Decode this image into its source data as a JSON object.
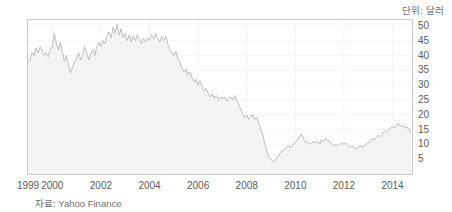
{
  "unit_label": "단위: 달러",
  "source_label": "자료: Yahoo Finance",
  "colors": {
    "line": "#b4b4b4",
    "area_fill": "#f4f4f4",
    "grid": "#eeeeee",
    "frame": "#c9c9c9",
    "tick_text": "#5b5b5b",
    "caption_text": "#6f6f6f",
    "background": "#ffffff"
  },
  "chart_data": {
    "type": "area",
    "title": "",
    "subtitle": "",
    "xlabel": "",
    "ylabel": "",
    "unit": "달러",
    "source": "Yahoo Finance",
    "grid": true,
    "legend": "none",
    "xlim": [
      1999.0,
      2014.8
    ],
    "ylim": [
      0,
      52
    ],
    "yticks": [
      5,
      10,
      15,
      20,
      25,
      30,
      35,
      40,
      45,
      50
    ],
    "ytick_labels": [
      "5",
      "10",
      "15",
      "20",
      "25",
      "30",
      "35",
      "40",
      "45",
      "50"
    ],
    "xticks": [
      1999,
      2000,
      2002,
      2004,
      2006,
      2008,
      2010,
      2012,
      2014
    ],
    "xtick_labels": [
      "1999",
      "2000",
      "2002",
      "2004",
      "2006",
      "2008",
      "2010",
      "2012",
      "2014"
    ],
    "series": [
      {
        "name": "주가",
        "x": [
          1999.0,
          1999.08,
          1999.17,
          1999.25,
          1999.33,
          1999.42,
          1999.5,
          1999.58,
          1999.67,
          1999.75,
          1999.83,
          1999.92,
          2000.0,
          2000.08,
          2000.17,
          2000.25,
          2000.33,
          2000.42,
          2000.5,
          2000.58,
          2000.67,
          2000.75,
          2000.83,
          2000.92,
          2001.0,
          2001.08,
          2001.17,
          2001.25,
          2001.33,
          2001.42,
          2001.5,
          2001.58,
          2001.67,
          2001.75,
          2001.83,
          2001.92,
          2002.0,
          2002.08,
          2002.17,
          2002.25,
          2002.33,
          2002.42,
          2002.5,
          2002.58,
          2002.67,
          2002.75,
          2002.83,
          2002.92,
          2003.0,
          2003.08,
          2003.17,
          2003.25,
          2003.33,
          2003.42,
          2003.5,
          2003.58,
          2003.67,
          2003.75,
          2003.83,
          2003.92,
          2004.0,
          2004.08,
          2004.17,
          2004.25,
          2004.33,
          2004.42,
          2004.5,
          2004.58,
          2004.67,
          2004.75,
          2004.83,
          2004.92,
          2005.0,
          2005.08,
          2005.17,
          2005.25,
          2005.33,
          2005.42,
          2005.5,
          2005.58,
          2005.67,
          2005.75,
          2005.83,
          2005.92,
          2006.0,
          2006.08,
          2006.17,
          2006.25,
          2006.33,
          2006.42,
          2006.5,
          2006.58,
          2006.67,
          2006.75,
          2006.83,
          2006.92,
          2007.0,
          2007.08,
          2007.17,
          2007.25,
          2007.33,
          2007.42,
          2007.5,
          2007.58,
          2007.67,
          2007.75,
          2007.83,
          2007.92,
          2008.0,
          2008.08,
          2008.17,
          2008.25,
          2008.33,
          2008.42,
          2008.5,
          2008.58,
          2008.67,
          2008.75,
          2008.83,
          2008.92,
          2009.0,
          2009.08,
          2009.17,
          2009.25,
          2009.33,
          2009.42,
          2009.5,
          2009.58,
          2009.67,
          2009.75,
          2009.83,
          2009.92,
          2010.0,
          2010.08,
          2010.17,
          2010.25,
          2010.33,
          2010.42,
          2010.5,
          2010.58,
          2010.67,
          2010.75,
          2010.83,
          2010.92,
          2011.0,
          2011.08,
          2011.17,
          2011.25,
          2011.33,
          2011.42,
          2011.5,
          2011.58,
          2011.67,
          2011.75,
          2011.83,
          2011.92,
          2012.0,
          2012.08,
          2012.17,
          2012.25,
          2012.33,
          2012.42,
          2012.5,
          2012.58,
          2012.67,
          2012.75,
          2012.83,
          2012.92,
          2013.0,
          2013.08,
          2013.17,
          2013.25,
          2013.33,
          2013.42,
          2013.5,
          2013.58,
          2013.67,
          2013.75,
          2013.83,
          2013.92,
          2014.0,
          2014.08,
          2014.17,
          2014.25,
          2014.33,
          2014.42,
          2014.5,
          2014.58,
          2014.67,
          2014.75
        ],
        "values": [
          37.5,
          38.5,
          41.0,
          40.0,
          42.5,
          41.0,
          43.0,
          41.5,
          40.0,
          41.0,
          39.5,
          42.0,
          43.0,
          47.5,
          44.0,
          42.0,
          44.5,
          41.0,
          38.0,
          40.0,
          36.5,
          34.0,
          36.0,
          38.0,
          39.0,
          41.0,
          38.5,
          40.0,
          43.0,
          41.0,
          38.5,
          40.5,
          42.0,
          40.0,
          43.0,
          44.5,
          43.0,
          45.0,
          44.0,
          46.5,
          48.0,
          46.0,
          49.5,
          47.5,
          50.5,
          47.0,
          49.0,
          46.0,
          47.5,
          45.0,
          47.0,
          44.5,
          46.5,
          45.0,
          47.0,
          45.5,
          44.0,
          46.0,
          44.5,
          46.0,
          45.0,
          47.0,
          45.5,
          47.5,
          46.0,
          44.5,
          46.5,
          45.0,
          46.5,
          44.0,
          42.0,
          41.0,
          40.0,
          41.5,
          39.0,
          37.5,
          36.0,
          34.5,
          35.5,
          33.5,
          34.5,
          32.5,
          31.0,
          32.0,
          30.0,
          31.5,
          29.5,
          28.0,
          29.0,
          27.0,
          26.0,
          27.0,
          25.5,
          26.5,
          25.0,
          26.0,
          25.5,
          26.0,
          24.5,
          25.5,
          26.0,
          25.0,
          26.5,
          25.0,
          23.5,
          22.0,
          20.5,
          19.0,
          20.0,
          18.5,
          19.5,
          20.0,
          18.5,
          19.0,
          17.0,
          15.0,
          13.0,
          10.0,
          7.5,
          5.5,
          5.0,
          4.2,
          4.5,
          5.5,
          6.5,
          7.5,
          8.0,
          8.5,
          9.0,
          9.5,
          9.0,
          10.0,
          10.5,
          11.5,
          12.5,
          13.5,
          12.0,
          10.5,
          11.0,
          10.0,
          10.5,
          11.0,
          10.5,
          11.0,
          10.0,
          11.5,
          11.0,
          12.0,
          11.5,
          11.0,
          10.0,
          9.5,
          10.0,
          9.5,
          10.0,
          10.5,
          10.0,
          10.5,
          9.5,
          9.0,
          9.5,
          9.0,
          8.5,
          9.0,
          9.5,
          9.0,
          9.5,
          10.0,
          10.5,
          11.0,
          12.0,
          11.5,
          12.5,
          13.0,
          12.5,
          13.5,
          14.5,
          14.0,
          15.0,
          15.5,
          16.0,
          15.5,
          16.5,
          17.0,
          16.0,
          16.5,
          15.5,
          16.0,
          15.0,
          14.0
        ]
      }
    ]
  }
}
